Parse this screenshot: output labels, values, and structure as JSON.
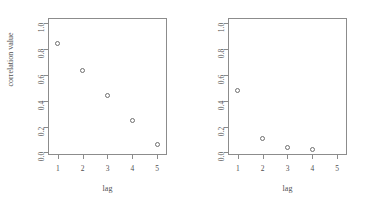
{
  "figure": {
    "background": "#ffffff",
    "axis_color": "#8c8c8c",
    "point_color": "#6e6e6e",
    "text_color": "#4f4f4f"
  },
  "chart_data": [
    {
      "type": "scatter",
      "panel": "left",
      "title": "",
      "xlabel": "lag",
      "ylabel": "correlation value",
      "x": [
        1,
        2,
        3,
        4,
        5
      ],
      "values": [
        0.84,
        0.63,
        0.44,
        0.25,
        0.06
      ],
      "xlim": [
        0.6,
        5.4
      ],
      "ylim": [
        -0.02,
        1.04
      ],
      "xticks": [
        1,
        2,
        3,
        4,
        5
      ],
      "xticklabels": [
        "1",
        "2",
        "3",
        "4",
        "5"
      ],
      "yticks": [
        0.0,
        0.2,
        0.4,
        0.6,
        0.8,
        1.0
      ],
      "yticklabels": [
        "0.0",
        "0.2",
        "0.4",
        "0.6",
        "0.8",
        "1.0"
      ],
      "marker": "open-circle",
      "grid": false,
      "legend": false
    },
    {
      "type": "scatter",
      "panel": "right",
      "title": "",
      "xlabel": "lag",
      "ylabel": "",
      "x": [
        1,
        2,
        3,
        4
      ],
      "values": [
        0.48,
        0.11,
        0.04,
        0.02
      ],
      "xlim": [
        0.6,
        5.4
      ],
      "ylim": [
        -0.02,
        1.04
      ],
      "xticks": [
        1,
        2,
        3,
        4,
        5
      ],
      "xticklabels": [
        "1",
        "2",
        "3",
        "4",
        "5"
      ],
      "yticks": [
        0.0,
        0.2,
        0.4,
        0.6,
        0.8,
        1.0
      ],
      "yticklabels": [
        "0.0",
        "0.2",
        "0.4",
        "0.6",
        "0.8",
        "1.0"
      ],
      "marker": "open-circle",
      "grid": false,
      "legend": false
    }
  ]
}
